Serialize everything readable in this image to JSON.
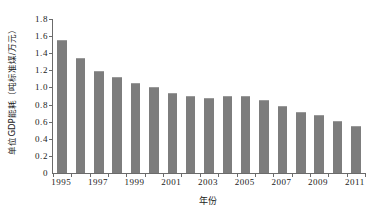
{
  "chart_data": {
    "type": "bar",
    "title": "",
    "xlabel": "年份",
    "ylabel": "单位GDP能耗（吨标准煤/万元）",
    "categories": [
      "1995",
      "1996",
      "1997",
      "1998",
      "1999",
      "2000",
      "2001",
      "2002",
      "2003",
      "2004",
      "2005",
      "2006",
      "2007",
      "2008",
      "2009",
      "2010",
      "2011"
    ],
    "values": [
      1.56,
      1.35,
      1.19,
      1.12,
      1.05,
      1.0,
      0.93,
      0.9,
      0.88,
      0.9,
      0.9,
      0.85,
      0.78,
      0.71,
      0.68,
      0.61,
      0.55
    ],
    "series": [
      {
        "name": "单位GDP能耗",
        "values": [
          1.56,
          1.35,
          1.19,
          1.12,
          1.05,
          1.0,
          0.93,
          0.9,
          0.88,
          0.9,
          0.9,
          0.85,
          0.78,
          0.71,
          0.68,
          0.61,
          0.55
        ]
      }
    ],
    "ylim": [
      0,
      1.8
    ],
    "ytick_labels": [
      "1.8",
      "1.6",
      "1.4",
      "1.2",
      "1.0",
      "0.8",
      "0.6",
      "0.4",
      "0.2",
      "0"
    ],
    "ytick_values": [
      1.8,
      1.6,
      1.4,
      1.2,
      1.0,
      0.8,
      0.6,
      0.4,
      0.2,
      0
    ],
    "xtick_labels": [
      "1995",
      "1997",
      "1999",
      "2001",
      "2003",
      "2005",
      "2007",
      "2009",
      "2011"
    ],
    "grid": false,
    "legend": false,
    "legend_position": "none",
    "bar_color": "#7d7d7d",
    "axis_color": "#6b6b6b",
    "background_color": "#ffffff"
  }
}
